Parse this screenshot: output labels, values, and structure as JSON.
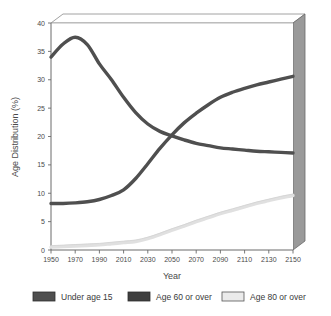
{
  "chart_data": {
    "type": "line",
    "title": "",
    "xlabel": "Year",
    "ylabel": "Age Distribution (%)",
    "xlim": [
      1950,
      2150
    ],
    "ylim": [
      0,
      40
    ],
    "grid": false,
    "legend_position": "bottom",
    "xticks": [
      "1950",
      "1970",
      "1990",
      "2010",
      "2030",
      "2050",
      "2070",
      "2090",
      "2110",
      "2130",
      "2150"
    ],
    "yticks": [
      "0",
      "5",
      "10",
      "15",
      "20",
      "25",
      "30",
      "35",
      "40"
    ],
    "x": [
      1950,
      1960,
      1970,
      1980,
      1990,
      2000,
      2010,
      2020,
      2030,
      2040,
      2050,
      2060,
      2070,
      2080,
      2090,
      2100,
      2110,
      2120,
      2130,
      2140,
      2150
    ],
    "series": [
      {
        "name": "Under age 15",
        "color": "#4f4f4f",
        "values": [
          34.0,
          36.3,
          37.5,
          36.2,
          32.8,
          30.0,
          26.9,
          24.2,
          22.2,
          20.9,
          20.1,
          19.4,
          18.8,
          18.4,
          18.0,
          17.8,
          17.6,
          17.4,
          17.3,
          17.2,
          17.1
        ]
      },
      {
        "name": "Age 60 or over",
        "color": "#4f4f4f",
        "values": [
          8.2,
          8.2,
          8.3,
          8.5,
          8.9,
          9.6,
          10.6,
          12.6,
          15.2,
          17.9,
          20.3,
          22.4,
          24.1,
          25.6,
          26.9,
          27.8,
          28.5,
          29.1,
          29.6,
          30.1,
          30.6
        ]
      },
      {
        "name": "Age 80 or over",
        "color": "#e0e0e0",
        "values": [
          0.5,
          0.6,
          0.7,
          0.8,
          0.9,
          1.1,
          1.3,
          1.5,
          2.0,
          2.7,
          3.5,
          4.2,
          5.0,
          5.7,
          6.4,
          7.0,
          7.6,
          8.2,
          8.7,
          9.2,
          9.6
        ]
      }
    ]
  },
  "legend": {
    "items": [
      {
        "label": "Under age 15",
        "swatch": "#4f4f4f",
        "border": "#2f2f2f"
      },
      {
        "label": "Age 60 or over",
        "swatch": "#3f3f3f",
        "border": "#2f2f2f"
      },
      {
        "label": "Age 80 or over",
        "swatch": "#ebebeb",
        "border": "#555555"
      }
    ]
  },
  "frame": {
    "top_slab_fill": "#ffffff",
    "side_slab_fill": "#9a9a9a",
    "axis_color": "#6a6a6a",
    "plot_bg": "#ffffff"
  }
}
